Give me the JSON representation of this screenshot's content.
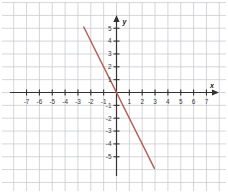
{
  "figure": {
    "kind": "cartesian-coordinate-plane",
    "background_color": "#ffffff",
    "grid_color": "#c9ccd1",
    "axis_color": "#333333",
    "line_color": "#b35b52"
  },
  "axes": {
    "x_label": "x",
    "y_label": "y",
    "x_ticks": [
      -7,
      -6,
      -5,
      -4,
      -3,
      -2,
      -1,
      1,
      2,
      3,
      4,
      5,
      6,
      7
    ],
    "y_ticks": [
      5,
      4,
      3,
      2,
      1,
      -1,
      -2,
      -3,
      -4,
      -5
    ],
    "x_tick_labels": [
      "-7",
      "-6",
      "-5",
      "-4",
      "-3",
      "-2",
      "-1",
      "1",
      "2",
      "3",
      "4",
      "5",
      "6",
      "7"
    ],
    "y_tick_labels": [
      "5",
      "4",
      "3",
      "2",
      "1",
      "-1",
      "-2",
      "-3",
      "-4",
      "-5"
    ],
    "origin_label": ""
  },
  "chart_data": {
    "type": "line",
    "title": "",
    "xlabel": "x",
    "ylabel": "y",
    "xlim": [
      -7.6,
      7.6
    ],
    "ylim": [
      -6.4,
      5.9
    ],
    "grid": true,
    "legend": null,
    "series": [
      {
        "name": "y = -2x",
        "color": "#b35b52",
        "slope": -2,
        "intercept": 0,
        "x": [
          -2.55,
          2.95
        ],
        "y": [
          5.1,
          -5.9
        ],
        "points": [
          {
            "x": -2,
            "y": 4
          },
          {
            "x": -1,
            "y": 2
          },
          {
            "x": 0,
            "y": 0
          },
          {
            "x": 1,
            "y": -2
          },
          {
            "x": 2,
            "y": -4
          }
        ]
      }
    ]
  }
}
